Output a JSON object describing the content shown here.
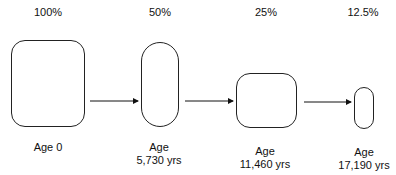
{
  "diagram": {
    "stages": [
      {
        "percent": "100%",
        "age_line1": "Age 0",
        "age_line2": ""
      },
      {
        "percent": "50%",
        "age_line1": "Age",
        "age_line2": "5,730 yrs"
      },
      {
        "percent": "25%",
        "age_line1": "Age",
        "age_line2": "11,460 yrs"
      },
      {
        "percent": "12.5%",
        "age_line1": "Age",
        "age_line2": "17,190 yrs"
      }
    ],
    "arrow_color": "#111111",
    "shape_stroke": "#222222"
  }
}
